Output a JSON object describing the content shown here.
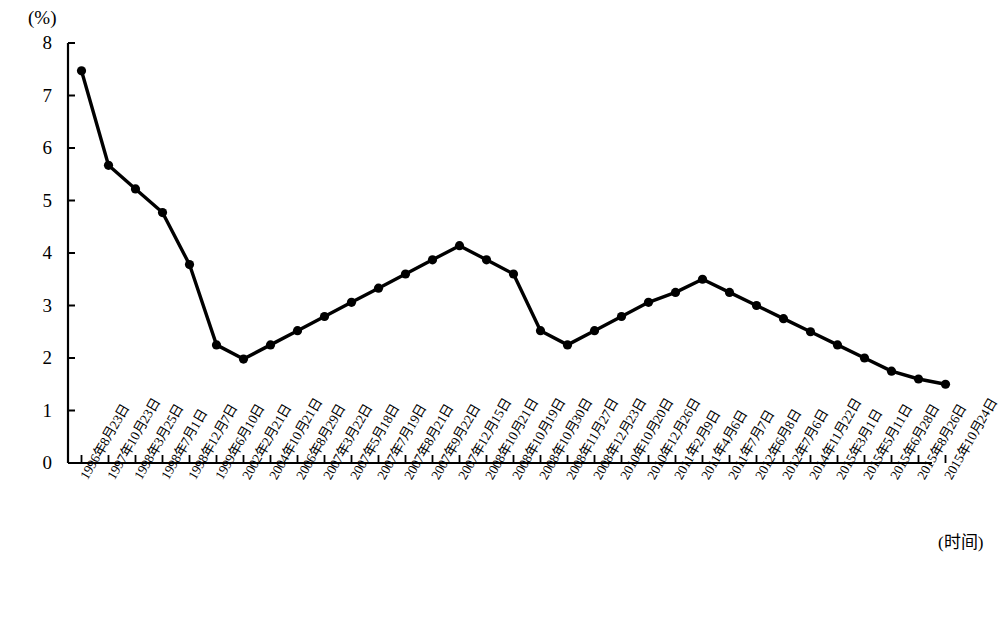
{
  "chart_data": {
    "type": "line",
    "title": "",
    "subtitle": "",
    "xlabel": "(时间)",
    "ylabel": "(%)",
    "ylim": [
      0,
      8
    ],
    "yticks": [
      0,
      1,
      2,
      3,
      4,
      5,
      6,
      7,
      8
    ],
    "ytick_labels": [
      "0",
      "1",
      "2",
      "3",
      "4",
      "5",
      "6",
      "7",
      "8"
    ],
    "grid": false,
    "legend": null,
    "legend_position": "none",
    "marker": "filled-circle",
    "line_color": "#000000",
    "marker_color": "#000000",
    "categories": [
      "1996年8月23日",
      "1997年10月23日",
      "1998年3月25日",
      "1998年7月1日",
      "1998年12月7日",
      "1999年6月10日",
      "2002年2月21日",
      "2004年10月21日",
      "2006年8月29日",
      "2007年3月22日",
      "2007年5月18日",
      "2007年7月19日",
      "2007年8月21日",
      "2007年9月22日",
      "2007年12月15日",
      "2008年10月21日",
      "2008年10月19日",
      "2008年10月30日",
      "2008年11月27日",
      "2008年12月23日",
      "2010年10月20日",
      "2010年12月26日",
      "2011年2月9日",
      "2011年4月6日",
      "2011年7月7日",
      "2012年6月8日",
      "2012年7月6日",
      "2014年11月22日",
      "2015年3月1日",
      "2015年5月11日",
      "2015年6月28日",
      "2015年8月26日",
      "2015年10月24日"
    ],
    "values": [
      7.47,
      5.67,
      5.22,
      4.77,
      3.78,
      2.25,
      1.98,
      2.25,
      2.52,
      2.79,
      3.06,
      3.33,
      3.6,
      3.87,
      4.14,
      3.87,
      3.6,
      2.52,
      2.25,
      2.52,
      2.79,
      3.06,
      3.25,
      3.5,
      3.25,
      3.0,
      2.75,
      2.5,
      2.25,
      2.0,
      1.75,
      1.6,
      1.5
    ],
    "series": [
      {
        "name": "一年期存款基准利率",
        "values": [
          7.47,
          5.67,
          5.22,
          4.77,
          3.78,
          2.25,
          1.98,
          2.25,
          2.52,
          2.79,
          3.06,
          3.33,
          3.6,
          3.87,
          4.14,
          3.87,
          3.6,
          2.52,
          2.25,
          2.52,
          2.79,
          3.06,
          3.25,
          3.5,
          3.25,
          3.0,
          2.75,
          2.5,
          2.25,
          2.0,
          1.75,
          1.6,
          1.5
        ]
      }
    ]
  },
  "axes": {
    "y_unit": "(%)",
    "x_title": "(时间)"
  }
}
